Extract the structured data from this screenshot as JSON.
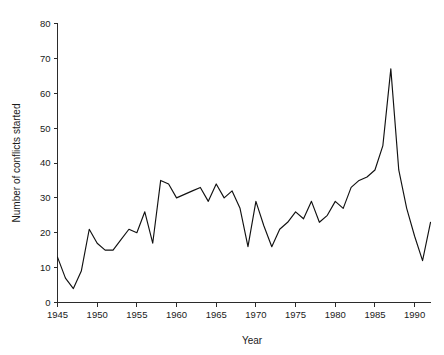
{
  "chart_data": {
    "type": "line",
    "title": "",
    "subtitle": "",
    "xlabel": "Year",
    "ylabel": "Number of conflicts started",
    "xlim": [
      1945,
      1992
    ],
    "ylim": [
      0,
      80
    ],
    "grid": false,
    "legend": null,
    "legend_position": "none",
    "line_color": "#111111",
    "axis_color": "#2b2b2b",
    "background_color": "#ffffff",
    "x_ticks": [
      1945,
      1950,
      1955,
      1960,
      1965,
      1970,
      1975,
      1980,
      1985,
      1990
    ],
    "x_tick_labels": [
      "1945",
      "1950",
      "1955",
      "1960",
      "1965",
      "1970",
      "1975",
      "1980",
      "1985",
      "1990"
    ],
    "y_ticks": [
      0,
      10,
      20,
      30,
      40,
      50,
      60,
      70,
      80
    ],
    "y_tick_labels": [
      "0",
      "10",
      "20",
      "30",
      "40",
      "50",
      "60",
      "70",
      "80"
    ],
    "x": [
      1945,
      1946,
      1947,
      1948,
      1949,
      1950,
      1951,
      1952,
      1953,
      1954,
      1955,
      1956,
      1957,
      1958,
      1959,
      1960,
      1961,
      1962,
      1963,
      1964,
      1965,
      1966,
      1967,
      1968,
      1969,
      1970,
      1971,
      1972,
      1973,
      1974,
      1975,
      1976,
      1977,
      1978,
      1979,
      1980,
      1981,
      1982,
      1983,
      1984,
      1985,
      1986,
      1987,
      1988,
      1989,
      1990,
      1991,
      1992
    ],
    "values": [
      13,
      7,
      4,
      9,
      21,
      17,
      15,
      15,
      18,
      21,
      20,
      26,
      17,
      35,
      34,
      30,
      31,
      32,
      33,
      29,
      34,
      30,
      32,
      27,
      16,
      29,
      22,
      16,
      21,
      23,
      26,
      24,
      29,
      23,
      25,
      29,
      27,
      33,
      35,
      36,
      38,
      45,
      67,
      38,
      27,
      19,
      12,
      23
    ],
    "series": [
      {
        "name": "Number of conflicts started",
        "values": [
          13,
          7,
          4,
          9,
          21,
          17,
          15,
          15,
          18,
          21,
          20,
          26,
          17,
          35,
          34,
          30,
          31,
          32,
          33,
          29,
          34,
          30,
          32,
          27,
          16,
          29,
          22,
          16,
          21,
          23,
          26,
          24,
          29,
          23,
          25,
          29,
          27,
          33,
          35,
          36,
          38,
          45,
          67,
          38,
          27,
          19,
          12,
          23
        ]
      }
    ],
    "annotations": []
  }
}
